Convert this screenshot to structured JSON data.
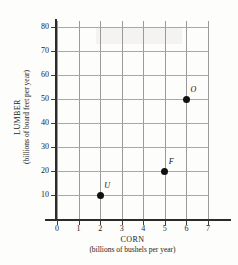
{
  "chart_data": {
    "type": "scatter",
    "title": "",
    "xlabel": "CORN",
    "xlabel_sub": "(billions of bushels per year)",
    "ylabel": "LUMBER",
    "ylabel_sub": "(billions of board feet per year)",
    "xlim": [
      0,
      7
    ],
    "ylim": [
      0,
      85
    ],
    "xticks": [
      "0",
      "1",
      "2",
      "3",
      "4",
      "5",
      "6",
      "7"
    ],
    "yticks": [
      "10",
      "20",
      "30",
      "40",
      "50",
      "60",
      "70",
      "80"
    ],
    "xtick_values": [
      0,
      1,
      2,
      3,
      4,
      5,
      6,
      7
    ],
    "ytick_values": [
      10,
      20,
      30,
      40,
      50,
      60,
      70,
      80
    ],
    "grid": true,
    "legend": "none",
    "points": [
      {
        "label": "U",
        "x": 2,
        "y": 10
      },
      {
        "label": "F",
        "x": 5,
        "y": 20
      },
      {
        "label": "O",
        "x": 6,
        "y": 50
      }
    ],
    "marker_color": "#111111",
    "grid_color": "#a0a0a0",
    "axis_color": "#2b2b2b"
  }
}
